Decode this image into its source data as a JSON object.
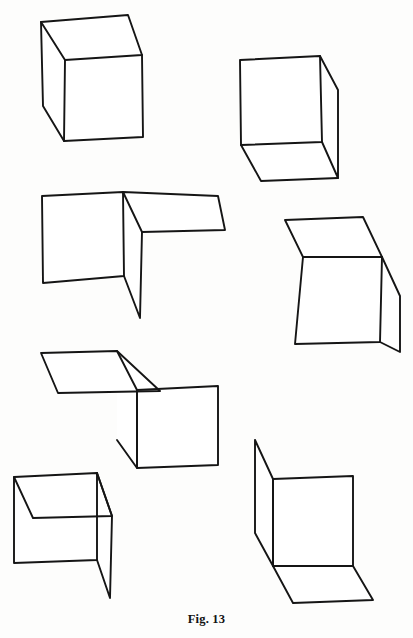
{
  "page": {
    "kind": "line-drawing-plate",
    "background_color": "#fdfdfc",
    "ink_color": "#151515",
    "width": 413,
    "height": 638
  },
  "caption": {
    "text": "Fig. 13",
    "align": "center"
  },
  "figures": [
    {
      "id": "figure-1",
      "name": "opaque-cube-upper-left",
      "description": "Solid cube seen from above-left: top face, front face, left face",
      "faces": [
        {
          "name": "top-face",
          "points": "41,22 128,15 142,55 65,60"
        },
        {
          "name": "front-face",
          "points": "65,60 142,55 143,137 64,141"
        },
        {
          "name": "left-face",
          "points": "41,22 65,60 64,141 43,106"
        }
      ],
      "edges": [
        "41,22 128,15 142,55 65,60 41,22",
        "65,60 64,141 143,137 142,55",
        "41,22 43,106 64,141"
      ]
    },
    {
      "id": "figure-2",
      "name": "cube-from-below-upper-right",
      "description": "Cube viewed from below-right: front face, right face, bottom face",
      "faces": [
        {
          "name": "front-face",
          "points": "240,60 320,56 322,142 241,145"
        },
        {
          "name": "right-face",
          "points": "320,56 338,90 338,178 322,142"
        },
        {
          "name": "bottom-face",
          "points": "241,145 322,142 338,178 261,181"
        }
      ],
      "edges": [
        "240,60 320,56 322,142 241,145 240,60",
        "320,56 338,90 338,178 322,142",
        "241,145 261,181 338,178"
      ]
    },
    {
      "id": "figure-3",
      "name": "open-corner-middle-left",
      "description": "Open trihedral corner: left wall, top flap to the right, vertical fin dropping down",
      "faces": [
        {
          "name": "left-wall-face",
          "points": "42,196 123,192 124,276 43,283"
        },
        {
          "name": "top-flap-face",
          "points": "123,192 218,196 225,230 142,232"
        },
        {
          "name": "vertical-fin-face",
          "points": "123,192 142,232 140,318 124,276"
        }
      ],
      "edges": [
        "42,196 123,192 124,276 43,283 42,196",
        "123,192 218,196 225,230 142,232 123,192",
        "142,232 140,318 124,276"
      ]
    },
    {
      "id": "figure-4",
      "name": "open-box-middle-right",
      "description": "Box corner: top face, front face, right flap angled back",
      "faces": [
        {
          "name": "top-face",
          "points": "285,220 363,217 382,257 303,257"
        },
        {
          "name": "front-face",
          "points": "303,257 382,257 380,342 295,344"
        },
        {
          "name": "right-flap-face",
          "points": "382,257 400,296 400,352 380,342"
        }
      ],
      "edges": [
        "285,220 363,217 382,257 303,257 285,220",
        "303,257 295,344 380,342 382,257",
        "382,257 400,296 400,352 380,342"
      ]
    },
    {
      "id": "figure-5",
      "name": "open-corner-middle-lower-left",
      "description": "Corner with top flap extending to the upper left, front face at right, side fin",
      "faces": [
        {
          "name": "top-flap-face",
          "points": "41,353 117,351 160,391 58,393"
        },
        {
          "name": "front-face",
          "points": "137,390 218,386 218,465 137,468"
        },
        {
          "name": "side-fin-face",
          "points": "117,351 137,390 137,468 117,440"
        }
      ],
      "edges": [
        "41,353 117,351 160,391 58,393 41,353",
        "117,351 137,390 137,468 117,440",
        "137,390 218,386 218,465 137,468 137,390"
      ]
    },
    {
      "id": "figure-6",
      "name": "open-cube-lower-left",
      "description": "Open cube: top face receding, front face, right fin dropping down",
      "faces": [
        {
          "name": "top-face",
          "points": "14,477 97,473 112,516 33,518"
        },
        {
          "name": "front-face",
          "points": "14,477 97,473 97,560 14,563"
        },
        {
          "name": "right-fin-face",
          "points": "97,473 112,516 110,598 97,560"
        }
      ],
      "edges": [
        "14,477 97,473 97,560 14,563 14,477",
        "14,477 33,518 112,516 97,473",
        "97,473 112,516 110,598 97,560"
      ]
    },
    {
      "id": "figure-7",
      "name": "open-corner-lower-right",
      "description": "Open corner: back wall face, left flap angled away, bottom floor flap",
      "faces": [
        {
          "name": "back-wall-face",
          "points": "273,479 353,476 353,566 273,566"
        },
        {
          "name": "left-flap-face",
          "points": "255,440 273,479 273,566 255,533"
        },
        {
          "name": "floor-flap-face",
          "points": "273,566 353,566 373,600 293,603"
        }
      ],
      "edges": [
        "273,479 353,476 353,566 273,566 273,479",
        "255,440 273,479 273,566 255,533 255,440",
        "273,566 293,603 373,600 353,566"
      ]
    }
  ]
}
